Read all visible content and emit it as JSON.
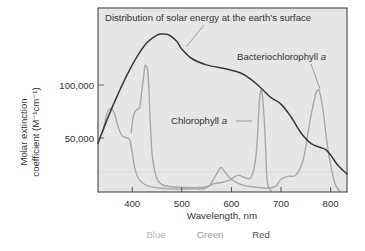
{
  "chart_data": {
    "type": "line",
    "title": "",
    "xlabel": "Wavelength, nm",
    "ylabel": "Molar extinction coefficient (M⁻¹cm⁻¹)",
    "ylabel_line1": "Molar extinction",
    "ylabel_line2": "coefficient (M⁻¹cm⁻¹)",
    "xlim": [
      331,
      833
    ],
    "ylim": [
      0,
      174000
    ],
    "grid": false,
    "x_ticks": [
      400,
      500,
      600,
      700,
      800
    ],
    "x_tick_labels": [
      "400",
      "500",
      "600",
      "700",
      "800"
    ],
    "y_ticks": [
      50000,
      100000
    ],
    "y_tick_labels": [
      "50,000",
      "100,000"
    ],
    "color_band_labels": [
      {
        "label": "Blue",
        "color": "#b8b8b8"
      },
      {
        "label": "Green",
        "color": "#a0a0a0"
      },
      {
        "label": "Red",
        "color": "#555555"
      }
    ],
    "annotations": [
      {
        "text": "Distribution of solar energy at the earth’s surface",
        "target": "solar"
      },
      {
        "text": "Bacteriochlorophyll a",
        "target": "bacteriochlorophyll"
      },
      {
        "text": "Chlorophyll a",
        "target": "chlorophyll"
      }
    ],
    "series": [
      {
        "name": "Distribution of solar energy at the earth’s surface",
        "key": "solar",
        "color": "#3a3a3a",
        "x": [
          331,
          350,
          370,
          390,
          410,
          430,
          450,
          460,
          475,
          490,
          500,
          520,
          550,
          580,
          600,
          620,
          640,
          660,
          680,
          700,
          720,
          740,
          760,
          780,
          790,
          800,
          815,
          833
        ],
        "values": [
          45000,
          68000,
          90000,
          110000,
          127000,
          140000,
          147000,
          148000,
          147000,
          141000,
          134000,
          125000,
          119000,
          116000,
          114000,
          111000,
          105000,
          97000,
          88000,
          82000,
          70000,
          55000,
          45000,
          41000,
          39000,
          34000,
          24000,
          16000
        ]
      },
      {
        "name": "Chlorophyll a",
        "key": "chlorophyll",
        "color": "#a8a8a8",
        "x": [
          398,
          403,
          410,
          415,
          420,
          425,
          428,
          432,
          436,
          440,
          448,
          460,
          480,
          520,
          550,
          565,
          580,
          595,
          605,
          615,
          625,
          640,
          650,
          657,
          662,
          667,
          672,
          680
        ],
        "values": [
          55000,
          72000,
          77000,
          79000,
          96000,
          116000,
          118000,
          110000,
          70000,
          35000,
          14000,
          6000,
          4000,
          3000,
          4000,
          7000,
          8000,
          10000,
          13000,
          15000,
          13000,
          13000,
          35000,
          88000,
          92000,
          60000,
          10000,
          0
        ]
      },
      {
        "name": "Bacteriochlorophyll a",
        "key": "bacteriochlorophyll",
        "color": "#a8a8a8",
        "x": [
          340,
          350,
          358,
          365,
          372,
          380,
          390,
          395,
          400,
          405,
          412,
          420,
          430,
          450,
          480,
          520,
          550,
          565,
          575,
          580,
          590,
          600,
          620,
          640,
          660,
          680,
          690,
          700,
          715,
          730,
          745,
          758,
          768,
          773,
          778,
          785,
          795,
          808,
          818
        ],
        "values": [
          55000,
          74000,
          78000,
          72000,
          60000,
          52000,
          50000,
          48000,
          36000,
          22000,
          12000,
          8000,
          5000,
          3000,
          2000,
          2000,
          3000,
          12000,
          20000,
          22000,
          16000,
          11000,
          6000,
          4000,
          3000,
          3000,
          5000,
          11000,
          14000,
          15000,
          30000,
          65000,
          88000,
          95000,
          93000,
          75000,
          38000,
          8000,
          0
        ]
      }
    ]
  },
  "labels": {
    "solar_annotation": "Distribution of solar energy at the earth’s surface",
    "bchl_annotation_main": "Bacteriochlorophyll ",
    "bchl_annotation_italic": "a",
    "chl_annotation_main": "Chlorophyll ",
    "chl_annotation_italic": "a"
  }
}
